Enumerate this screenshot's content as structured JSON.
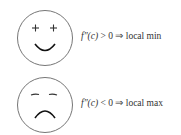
{
  "rows": [
    {
      "face": "smiley",
      "eyes": "+ +",
      "condition_fn": "f″(c)",
      "condition_op": "> 0 ⇒ local min"
    },
    {
      "face": "frowny",
      "eyes": "– –",
      "condition_fn": "f″(c)",
      "condition_op": "< 0 ⇒ local max"
    }
  ],
  "colors": {
    "stroke": "#555555",
    "text": "#333333"
  }
}
